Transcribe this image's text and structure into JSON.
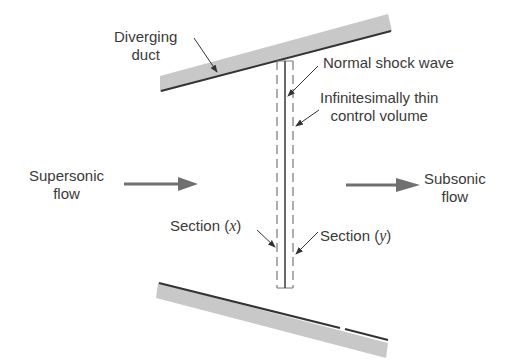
{
  "diagram": {
    "labels": {
      "diverging_duct_line1": "Diverging",
      "diverging_duct_line2": "duct",
      "normal_shock": "Normal shock wave",
      "control_volume_line1": "Infinitesimally thin",
      "control_volume_line2": "control volume",
      "supersonic_line1": "Supersonic",
      "supersonic_line2": "flow",
      "subsonic_line1": "Subsonic",
      "subsonic_line2": "flow",
      "section_x_prefix": "Section (",
      "section_x_var": "x",
      "section_x_suffix": ")",
      "section_y_prefix": "Section (",
      "section_y_var": "y",
      "section_y_suffix": ")"
    },
    "colors": {
      "wall_fill": "#c8c8c8",
      "wall_edge": "#333333",
      "arrow": "#707070",
      "line": "#444444",
      "dash": "#777777",
      "text": "#3a3a3a"
    }
  }
}
